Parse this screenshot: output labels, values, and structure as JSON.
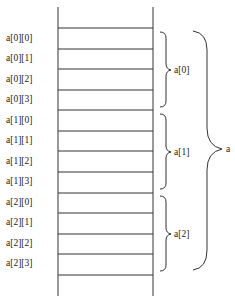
{
  "diagram": {
    "elements": [
      "a[0][0]",
      "a[0][1]",
      "a[0][2]",
      "a[0][3]",
      "a[1][0]",
      "a[1][1]",
      "a[1][2]",
      "a[1][3]",
      "a[2][0]",
      "a[2][1]",
      "a[2][2]",
      "a[2][3]"
    ],
    "row_groups": [
      "a[0]",
      "a[1]",
      "a[2]"
    ],
    "array_label": "a",
    "colors": {
      "line": "#333333",
      "text": "#222222",
      "background": "#ffffff"
    }
  }
}
